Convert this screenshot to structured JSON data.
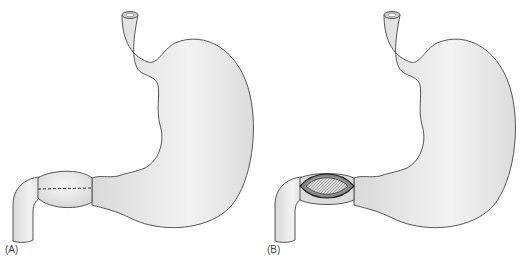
{
  "figure": {
    "colors": {
      "organ_fill": "#e6e6e6",
      "organ_highlight": "#f6f6f6",
      "outline": "#555555",
      "incision_dark": "#2a2a2a",
      "background": "#ffffff"
    },
    "panels": [
      {
        "label": "(A)",
        "feature": "dashed incision line across pylorus"
      },
      {
        "label": "(B)",
        "feature": "opened pyloric incision showing mucosa"
      }
    ]
  }
}
